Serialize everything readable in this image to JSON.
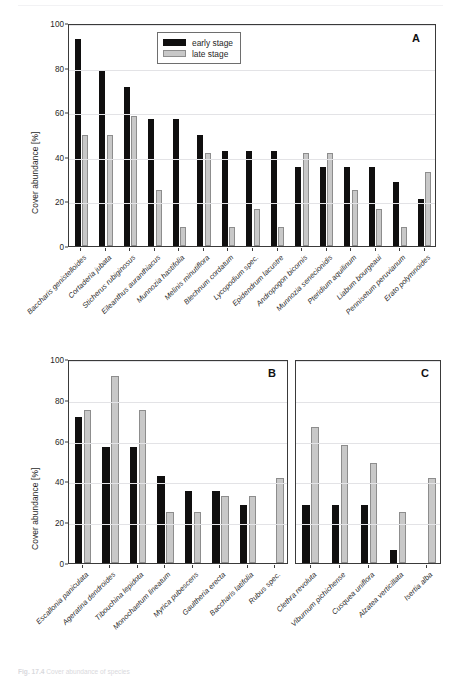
{
  "page": {
    "running_head": "",
    "folio": "",
    "caption_number": "Fig. 17.4",
    "caption_text": "Cover abundance of species"
  },
  "figure": {
    "axis": {
      "ylabel": "Cover abundance [%]",
      "yticks": [
        0,
        20,
        40,
        60,
        80,
        100
      ],
      "ymin": 0,
      "ymax": 100
    },
    "legend": {
      "position": "top-center-of-panel-A",
      "items": [
        {
          "key": "early",
          "label": "early stage",
          "color": "#100f0f"
        },
        {
          "key": "late",
          "label": "late stage",
          "color": "#c8c8c8"
        }
      ]
    },
    "panels": [
      {
        "id": "A",
        "letter": "A"
      },
      {
        "id": "B",
        "letter": "B"
      },
      {
        "id": "C",
        "letter": "C"
      }
    ]
  },
  "chart_data": [
    {
      "id": "A",
      "type": "bar",
      "title": "A",
      "xlabel": "",
      "ylabel": "Cover abundance [%]",
      "ylim": [
        0,
        100
      ],
      "yticks": [
        0,
        20,
        40,
        60,
        80,
        100
      ],
      "grid": true,
      "legend": [
        "early stage",
        "late stage"
      ],
      "categories": [
        "Baccharis genistelloides",
        "Cortaderia jubata",
        "Sticherus rubiginosus",
        "Eileanthus auranthiacus",
        "Munnozia hastifolia",
        "Melinis minutiflora",
        "Blechnum cordatum",
        "Lycopodium spec.",
        "Epidendrum lacustre",
        "Andropogon bicornis",
        "Munnozia senecionidis",
        "Pteridium aquilinum",
        "Liabum bourgeaui",
        "Pennisetum peruvianum",
        "Erato polymnoides"
      ],
      "series": [
        {
          "name": "early stage",
          "values": [
            93,
            78.5,
            71.5,
            57,
            57,
            50,
            42.5,
            42.5,
            42.5,
            35.5,
            35.5,
            35.5,
            35.5,
            28.5,
            21
          ]
        },
        {
          "name": "late stage",
          "values": [
            50,
            50,
            58.5,
            25,
            8.5,
            41.5,
            8.5,
            16.5,
            8.5,
            41.5,
            41.5,
            25,
            16.5,
            8.5,
            33
          ]
        }
      ]
    },
    {
      "id": "B",
      "type": "bar",
      "title": "B",
      "xlabel": "",
      "ylabel": "Cover abundance [%]",
      "ylim": [
        0,
        100
      ],
      "yticks": [
        0,
        20,
        40,
        60,
        80,
        100
      ],
      "grid": true,
      "legend": [
        "early stage",
        "late stage"
      ],
      "categories": [
        "Escallonia paniculata",
        "Ageratina dendroides",
        "Tibouchina lepidota",
        "Monochaetum lineatum",
        "Myrica pubescens",
        "Gaultheria erecta",
        "Baccharis latifolia",
        "Rubus spec."
      ],
      "series": [
        {
          "name": "early stage",
          "values": [
            71.5,
            57,
            57,
            42.5,
            35.5,
            35.5,
            28.5,
            0
          ]
        },
        {
          "name": "late stage",
          "values": [
            75,
            91.5,
            75,
            25,
            25,
            33,
            33,
            41.5
          ]
        }
      ]
    },
    {
      "id": "C",
      "type": "bar",
      "title": "C",
      "xlabel": "",
      "ylabel": "",
      "ylim": [
        0,
        100
      ],
      "yticks": [
        0,
        20,
        40,
        60,
        80,
        100
      ],
      "grid": true,
      "legend": [
        "early stage",
        "late stage"
      ],
      "categories": [
        "Clethra revoluta",
        "Viburnum pichichense",
        "Cusquea uniflora",
        "Alzatea verticillata",
        "Isertia alba"
      ],
      "series": [
        {
          "name": "early stage",
          "values": [
            28.5,
            28.5,
            28.5,
            6.5,
            0
          ]
        },
        {
          "name": "late stage",
          "values": [
            66.5,
            58,
            49,
            25,
            41.5
          ]
        }
      ]
    }
  ]
}
